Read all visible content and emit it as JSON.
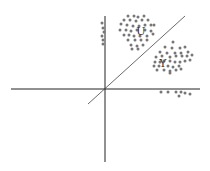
{
  "diagram": {
    "type": "scatter-classification",
    "colors": {
      "axis": "#222222",
      "dot": "#777777",
      "boundary": "#444444"
    },
    "axes": {
      "x_axis": {
        "x1": 11,
        "y1": 89,
        "x2": 200,
        "y2": 89
      },
      "y_axis": {
        "x1": 105,
        "y1": 16,
        "x2": 105,
        "y2": 162
      }
    },
    "boundary_line": {
      "x1": 88,
      "y1": 104,
      "x2": 185,
      "y2": 16
    },
    "clusters": [
      {
        "label": "U",
        "label_pos": [
          141,
          35
        ],
        "points": [
          [
            128,
            16
          ],
          [
            134,
            16
          ],
          [
            138,
            17
          ],
          [
            144,
            16
          ],
          [
            124,
            20
          ],
          [
            130,
            20
          ],
          [
            136,
            21
          ],
          [
            142,
            20
          ],
          [
            148,
            20
          ],
          [
            121,
            24
          ],
          [
            127,
            25
          ],
          [
            133,
            26
          ],
          [
            139,
            26
          ],
          [
            145,
            25
          ],
          [
            151,
            25
          ],
          [
            154,
            25
          ],
          [
            120,
            30
          ],
          [
            126,
            30
          ],
          [
            131,
            31
          ],
          [
            137,
            30
          ],
          [
            145,
            30
          ],
          [
            151,
            31
          ],
          [
            124,
            35
          ],
          [
            129,
            35
          ],
          [
            134,
            36
          ],
          [
            140,
            36
          ],
          [
            147,
            36
          ],
          [
            153,
            34
          ],
          [
            128,
            40
          ],
          [
            135,
            40
          ],
          [
            141,
            40
          ],
          [
            147,
            40
          ],
          [
            131,
            45
          ],
          [
            137,
            46
          ],
          [
            143,
            45
          ],
          [
            132,
            49
          ],
          [
            138,
            49
          ]
        ]
      },
      {
        "label": "Y",
        "label_pos": [
          163,
          67
        ],
        "points": [
          [
            173,
            42
          ],
          [
            165,
            47
          ],
          [
            172,
            48
          ],
          [
            180,
            48
          ],
          [
            185,
            47
          ],
          [
            160,
            52
          ],
          [
            167,
            53
          ],
          [
            175,
            53
          ],
          [
            181,
            53
          ],
          [
            188,
            52
          ],
          [
            156,
            57
          ],
          [
            162,
            56
          ],
          [
            170,
            57
          ],
          [
            176,
            56
          ],
          [
            182,
            56
          ],
          [
            187,
            56
          ],
          [
            192,
            55
          ],
          [
            155,
            62
          ],
          [
            160,
            62
          ],
          [
            164,
            61
          ],
          [
            170,
            61
          ],
          [
            175,
            62
          ],
          [
            180,
            62
          ],
          [
            185,
            61
          ],
          [
            190,
            60
          ],
          [
            154,
            66
          ],
          [
            159,
            66
          ],
          [
            168,
            66
          ],
          [
            173,
            67
          ],
          [
            179,
            66
          ],
          [
            157,
            70
          ],
          [
            164,
            70
          ],
          [
            170,
            71
          ],
          [
            176,
            70
          ],
          [
            181,
            69
          ],
          [
            170,
            73
          ]
        ]
      },
      {
        "label": "",
        "points": [
          [
            102,
            23
          ],
          [
            103,
            28
          ],
          [
            104,
            32
          ],
          [
            102,
            36
          ],
          [
            103,
            40
          ],
          [
            103,
            44
          ],
          [
            161,
            92
          ],
          [
            168,
            92
          ],
          [
            176,
            92
          ],
          [
            181,
            92
          ],
          [
            185,
            93
          ],
          [
            179,
            96
          ],
          [
            190,
            94
          ]
        ]
      }
    ]
  }
}
